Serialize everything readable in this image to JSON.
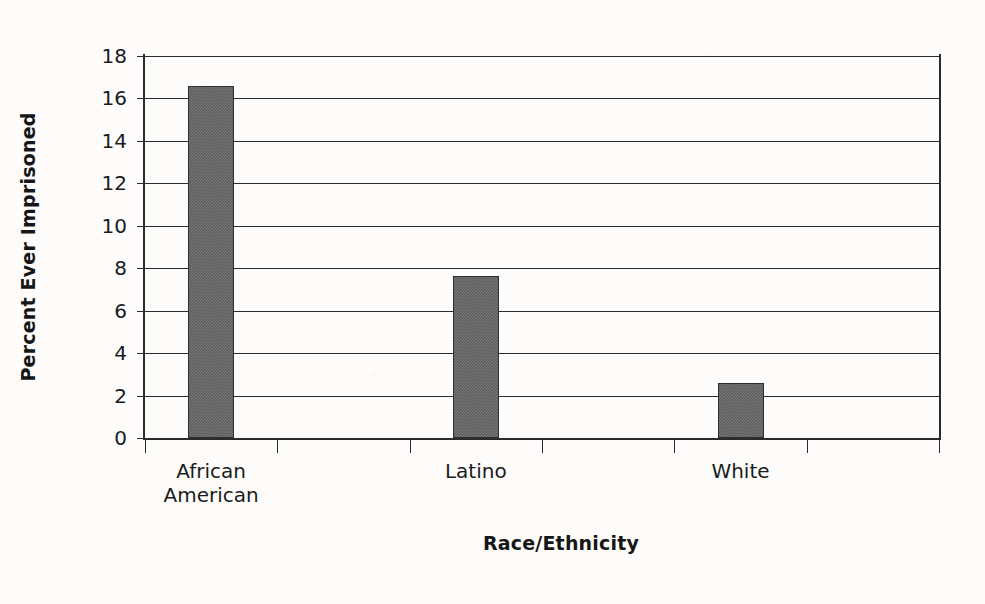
{
  "chart_data": {
    "type": "bar",
    "title": "",
    "xlabel": "Race/Ethnicity",
    "ylabel": "Percent Ever Imprisoned",
    "categories": [
      "African\nAmerican",
      "Latino",
      "White"
    ],
    "values": [
      16.6,
      7.65,
      2.6
    ],
    "ylim": [
      0,
      18
    ],
    "yticks": [
      0,
      2,
      4,
      6,
      8,
      10,
      12,
      14,
      16,
      18
    ],
    "ytick_labels": [
      "0",
      "2",
      "4",
      "6",
      "8",
      "10",
      "12",
      "14",
      "16",
      "18"
    ],
    "xtick_count": 7,
    "grid": "horizontal",
    "legend": "none",
    "bar_color": "#5e5e5e",
    "bar_edge_color": "#2e2e2e",
    "axis_color": "#2b2b2b",
    "background_color": "#fdfcfa"
  }
}
